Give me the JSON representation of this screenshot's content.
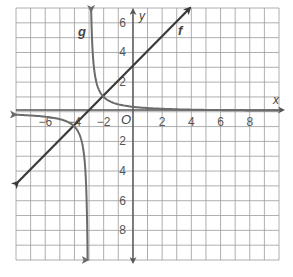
{
  "graph": {
    "x_range": [
      -8,
      10
    ],
    "y_range": [
      -10,
      7
    ],
    "axis_labels": {
      "x": "x",
      "y": "y",
      "origin": "O"
    },
    "x_ticks": [
      {
        "value": -6,
        "label": "−6"
      },
      {
        "value": -4,
        "label": "−4"
      },
      {
        "value": -2,
        "label": "−2"
      },
      {
        "value": 2,
        "label": "2"
      },
      {
        "value": 4,
        "label": "4"
      },
      {
        "value": 6,
        "label": "6"
      },
      {
        "value": 8,
        "label": "8"
      }
    ],
    "y_ticks": [
      {
        "value": 6,
        "label": "6"
      },
      {
        "value": 4,
        "label": "4"
      },
      {
        "value": 2,
        "label": "2"
      },
      {
        "value": -2,
        "label": "2"
      },
      {
        "value": -4,
        "label": "4"
      },
      {
        "value": -6,
        "label": "6"
      },
      {
        "value": -8,
        "label": "8"
      }
    ],
    "functions": [
      {
        "name": "f",
        "label": "f",
        "type": "line",
        "description": "f(x) = x + 3",
        "color": "#3a3a3a"
      },
      {
        "name": "g",
        "label": "g",
        "type": "hyperbola",
        "description": "g(x) = 1/(x + 3)",
        "color": "#6b6b6b"
      }
    ],
    "colors": {
      "grid": "#9a9a9a",
      "axis": "#555555",
      "f": "#3a3a3a",
      "g": "#6b6b6b"
    }
  }
}
